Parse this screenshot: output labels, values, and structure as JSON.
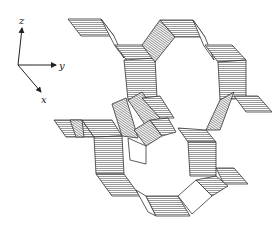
{
  "figure": {
    "type": "3D crystal framework line drawing",
    "axes": {
      "z_label": "z",
      "y_label": "y",
      "x_label": "x"
    },
    "colors": {
      "ink": "#333333",
      "background": "#ffffff",
      "hatch": "#555555"
    }
  }
}
